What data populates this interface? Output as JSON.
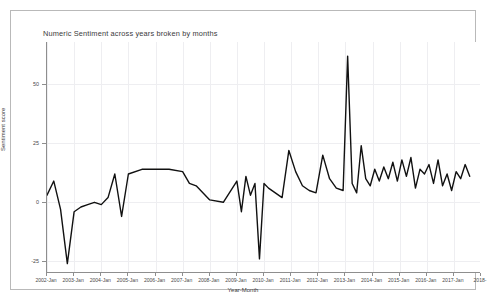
{
  "window": {
    "background_color": "#ffffff",
    "border_color": "#b9b9b9"
  },
  "chart_data": {
    "type": "line",
    "title": "Numeric Sentiment across years broken by months",
    "xlabel": "Year-Month",
    "ylabel": "Sentiment score",
    "grid": true,
    "legend": "none",
    "line_color": "#111111",
    "line_width": 1.4,
    "ylim": [
      -30,
      68
    ],
    "yticks": [
      -25,
      0,
      25,
      50
    ],
    "ytick_labels": [
      "-25",
      "0",
      "25",
      "50"
    ],
    "xlim": [
      "2002-Jan",
      "2018-Jan"
    ],
    "xticks": [
      "2002-Jan",
      "2003-Jan",
      "2004-Jan",
      "2005-Jan",
      "2006-Jan",
      "2007-Jan",
      "2008-Jan",
      "2009-Jan",
      "2010-Jan",
      "2011-Jan",
      "2012-Jan",
      "2013-Jan",
      "2014-Jan",
      "2015-Jan",
      "2016-Jan",
      "2017-Jan",
      "2018-"
    ],
    "x": [
      "2002-Jan",
      "2002-Apr",
      "2002-Jul",
      "2002-Oct",
      "2003-Jan",
      "2003-Apr",
      "2003-Jul",
      "2003-Oct",
      "2004-Jan",
      "2004-Apr",
      "2004-Jul",
      "2004-Oct",
      "2005-Jan",
      "2005-Jul",
      "2006-Jan",
      "2006-Jul",
      "2007-Jan",
      "2007-Apr",
      "2007-Jul",
      "2008-Jan",
      "2008-Jul",
      "2009-Jan",
      "2009-Mar",
      "2009-May",
      "2009-Jul",
      "2009-Sep",
      "2009-Nov",
      "2010-Jan",
      "2010-Mar",
      "2010-Jun",
      "2010-Sep",
      "2010-Dec",
      "2011-Mar",
      "2011-Jun",
      "2011-Sep",
      "2011-Dec",
      "2012-Mar",
      "2012-Jun",
      "2012-Sep",
      "2012-Dec",
      "2013-Feb",
      "2013-Apr",
      "2013-Jun",
      "2013-Aug",
      "2013-Oct",
      "2013-Dec",
      "2014-Feb",
      "2014-Apr",
      "2014-Jun",
      "2014-Aug",
      "2014-Oct",
      "2014-Dec",
      "2015-Feb",
      "2015-Apr",
      "2015-Jun",
      "2015-Aug",
      "2015-Oct",
      "2015-Dec",
      "2016-Feb",
      "2016-Apr",
      "2016-Jun",
      "2016-Aug",
      "2016-Oct",
      "2016-Dec",
      "2017-Feb",
      "2017-Apr",
      "2017-Jun",
      "2017-Aug"
    ],
    "values": [
      3,
      9,
      -3,
      -26,
      -4,
      -2,
      -1,
      0,
      -1,
      2,
      12,
      -6,
      12,
      14,
      14,
      14,
      13,
      8,
      7,
      1,
      0,
      9,
      -4,
      11,
      3,
      8,
      -24,
      8,
      6,
      4,
      2,
      22,
      13,
      7,
      5,
      4,
      20,
      10,
      6,
      5,
      62,
      8,
      4,
      24,
      10,
      7,
      14,
      9,
      15,
      10,
      17,
      9,
      18,
      11,
      19,
      6,
      14,
      12,
      16,
      8,
      18,
      7,
      12,
      5,
      13,
      10,
      16,
      11
    ]
  }
}
